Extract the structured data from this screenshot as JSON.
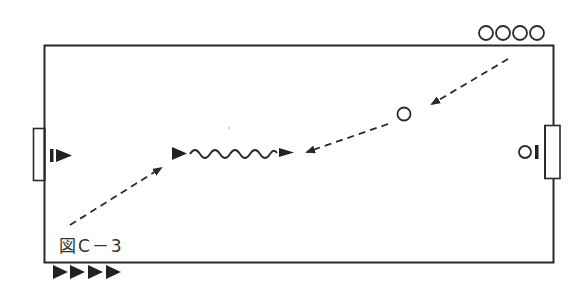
{
  "figure": {
    "caption": "図C－3",
    "colors": {
      "line": "#2a2a2a",
      "background": "#ffffff"
    }
  },
  "field": {
    "description": "rectangular pitch with a goal on the left and right sides",
    "left_goal": "goal",
    "right_goal": "goal"
  },
  "players": {
    "waiting_circles_top_right": 4,
    "waiting_triangles_bottom_left": 4,
    "left_goalkeeper": "I▶",
    "right_goalkeeper": "OI",
    "passer_circle": "O",
    "dribbler_triangle": "▶"
  },
  "movements": [
    {
      "type": "pass",
      "style": "dashed-arrow",
      "from": "top-right circles",
      "to": "center-right circle"
    },
    {
      "type": "pass",
      "style": "dashed-arrow",
      "from": "center-right circle",
      "to": "center"
    },
    {
      "type": "run",
      "style": "dashed-arrow",
      "from": "bottom-left",
      "to": "triangle player"
    },
    {
      "type": "dribble",
      "style": "wavy-line",
      "from": "triangle player",
      "to": "center"
    }
  ]
}
